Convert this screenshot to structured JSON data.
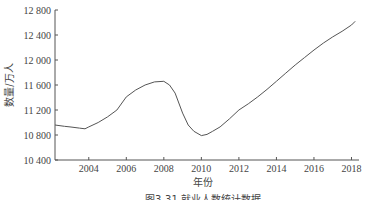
{
  "chart_data": {
    "type": "line",
    "title": "",
    "caption": "图3-31  就业人数统计数据",
    "xlabel": "年份",
    "ylabel": "数量/万人",
    "xlim": [
      2002.2,
      2018.4
    ],
    "ylim": [
      10400,
      12800
    ],
    "x_ticks": [
      2004,
      2006,
      2008,
      2010,
      2012,
      2014,
      2016,
      2018
    ],
    "y_ticks": [
      10400,
      10800,
      11200,
      11600,
      12000,
      12400,
      12800
    ],
    "y_tick_labels": [
      "10 400",
      "10 800",
      "11 200",
      "11 600",
      "12 000",
      "12 400",
      "12 800"
    ],
    "grid": false,
    "legend": null,
    "series": [
      {
        "name": "数量",
        "color": "#555555",
        "x": [
          2002.2,
          2002.7,
          2003.0,
          2003.5,
          2003.8,
          2004.0,
          2004.5,
          2005.0,
          2005.5,
          2006.0,
          2006.5,
          2007.0,
          2007.5,
          2008.0,
          2008.3,
          2008.6,
          2009.0,
          2009.3,
          2009.6,
          2010.0,
          2010.3,
          2010.6,
          2011.0,
          2011.5,
          2012.0,
          2012.5,
          2013.0,
          2013.5,
          2014.0,
          2014.5,
          2015.0,
          2015.5,
          2016.0,
          2016.5,
          2017.0,
          2017.5,
          2018.0,
          2018.2
        ],
        "values": [
          10960,
          10940,
          10930,
          10910,
          10900,
          10930,
          11000,
          11090,
          11200,
          11410,
          11520,
          11600,
          11650,
          11660,
          11600,
          11470,
          11150,
          10960,
          10860,
          10790,
          10810,
          10860,
          10930,
          11060,
          11200,
          11300,
          11410,
          11530,
          11660,
          11790,
          11920,
          12040,
          12160,
          12270,
          12370,
          12460,
          12560,
          12620
        ]
      }
    ]
  }
}
